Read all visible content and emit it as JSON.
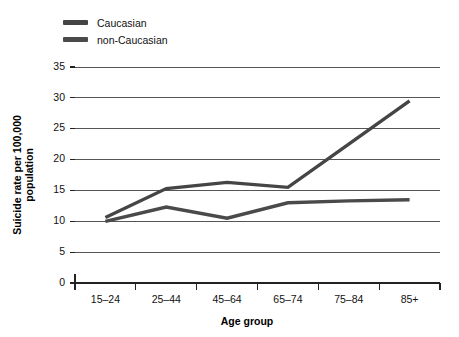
{
  "chart_data": {
    "type": "line",
    "title": "",
    "xlabel": "Age group",
    "ylabel": "Suicide rate per 100,000 population",
    "ylabel_line1": "Suicide rate per 100,000",
    "ylabel_line2": "population",
    "categories": [
      "15–24",
      "25–44",
      "45–64",
      "65–74",
      "75–84",
      "85+"
    ],
    "ylim": [
      0,
      35
    ],
    "yticks": [
      0,
      5,
      10,
      15,
      20,
      25,
      30,
      35
    ],
    "ytick_labels": [
      "0",
      "5",
      "10",
      "15",
      "20",
      "25",
      "30",
      "35"
    ],
    "grid": true,
    "legend_position": "top-left",
    "series": [
      {
        "name": "Caucasian",
        "color": "#454545",
        "values": [
          10.6,
          15.3,
          16.3,
          15.5,
          22.5,
          29.5
        ]
      },
      {
        "name": "non-Caucasian",
        "color": "#4a4a4a",
        "values": [
          10.0,
          12.3,
          10.5,
          13.0,
          13.3,
          13.5
        ]
      }
    ]
  },
  "legend": {
    "items": [
      {
        "label": "Caucasian",
        "color": "#454545"
      },
      {
        "label": "non-Caucasian",
        "color": "#4a4a4a"
      }
    ]
  },
  "colors": {
    "background": "#ffffff",
    "gridline": "#555555",
    "axis": "#222222",
    "text": "#111111"
  }
}
